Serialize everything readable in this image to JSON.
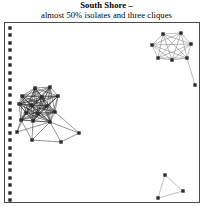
{
  "chart_title": "South Shore –",
  "chart_subtitle": "almost 50% isolates and three cliques",
  "colors": {
    "node": "#2b2b2b",
    "edge": "#6b6b6b",
    "edge_dark": "#1a1a1a",
    "frame": "#4a4a4a",
    "background": "#ffffff",
    "text": "#000000"
  },
  "chart_data": {
    "type": "scatter",
    "subtype": "network-graph",
    "title": "South Shore –",
    "subtitle": "almost 50% isolates and three cliques",
    "xlabel": "",
    "ylabel": "",
    "grid": false,
    "legend": "none",
    "xlim": [
      0,
      213
    ],
    "ylim": [
      0,
      207
    ],
    "summary": {
      "isolates_count": 24,
      "cliques_count": 3,
      "isolate_fraction_label": "almost 50%",
      "total_nodes": 50
    },
    "node_style": {
      "shape": "square",
      "size_px": 3.4,
      "color": "#2b2b2b"
    },
    "groups": [
      {
        "name": "isolates-column",
        "kind": "isolates",
        "node_count": 24,
        "edge_count": 0
      },
      {
        "name": "left-clique",
        "kind": "dense-clique",
        "node_count": 14,
        "pendant_count": 4,
        "description": "dense near-complete cluster on lower left with pendant nodes"
      },
      {
        "name": "top-right-clique",
        "kind": "dense-clique",
        "node_count": 7,
        "pendant_count": 1,
        "description": "near-complete 7-node clique upper right with one pendant"
      },
      {
        "name": "bottom-right-triangle",
        "kind": "triangle",
        "node_count": 3,
        "edge_count": 3,
        "description": "three-node triangle lower right"
      }
    ],
    "nodes": [
      {
        "id": "i1",
        "x": 10,
        "y": 28,
        "group": "isolates-column"
      },
      {
        "id": "i2",
        "x": 10,
        "y": 35,
        "group": "isolates-column"
      },
      {
        "id": "i3",
        "x": 10,
        "y": 43,
        "group": "isolates-column"
      },
      {
        "id": "i4",
        "x": 10,
        "y": 50,
        "group": "isolates-column"
      },
      {
        "id": "i5",
        "x": 10,
        "y": 58,
        "group": "isolates-column"
      },
      {
        "id": "i6",
        "x": 10,
        "y": 65,
        "group": "isolates-column"
      },
      {
        "id": "i7",
        "x": 10,
        "y": 73,
        "group": "isolates-column"
      },
      {
        "id": "i8",
        "x": 10,
        "y": 80,
        "group": "isolates-column"
      },
      {
        "id": "i9",
        "x": 10,
        "y": 88,
        "group": "isolates-column"
      },
      {
        "id": "i10",
        "x": 10,
        "y": 95,
        "group": "isolates-column"
      },
      {
        "id": "i11",
        "x": 10,
        "y": 103,
        "group": "isolates-column"
      },
      {
        "id": "i12",
        "x": 10,
        "y": 110,
        "group": "isolates-column"
      },
      {
        "id": "i13",
        "x": 10,
        "y": 118,
        "group": "isolates-column"
      },
      {
        "id": "i14",
        "x": 10,
        "y": 125,
        "group": "isolates-column"
      },
      {
        "id": "i15",
        "x": 10,
        "y": 133,
        "group": "isolates-column"
      },
      {
        "id": "i16",
        "x": 10,
        "y": 140,
        "group": "isolates-column"
      },
      {
        "id": "i17",
        "x": 10,
        "y": 148,
        "group": "isolates-column"
      },
      {
        "id": "i18",
        "x": 10,
        "y": 155,
        "group": "isolates-column"
      },
      {
        "id": "i19",
        "x": 10,
        "y": 163,
        "group": "isolates-column"
      },
      {
        "id": "i20",
        "x": 10,
        "y": 170,
        "group": "isolates-column"
      },
      {
        "id": "i21",
        "x": 10,
        "y": 178,
        "group": "isolates-column"
      },
      {
        "id": "i22",
        "x": 10,
        "y": 185,
        "group": "isolates-column"
      },
      {
        "id": "i23",
        "x": 10,
        "y": 193,
        "group": "isolates-column"
      },
      {
        "id": "i24",
        "x": 10,
        "y": 200,
        "group": "isolates-column"
      },
      {
        "id": "L1",
        "x": 35,
        "y": 88,
        "group": "left-clique"
      },
      {
        "id": "L2",
        "x": 50,
        "y": 87,
        "group": "left-clique"
      },
      {
        "id": "L3",
        "x": 22,
        "y": 96,
        "group": "left-clique"
      },
      {
        "id": "L4",
        "x": 42,
        "y": 97,
        "group": "left-clique"
      },
      {
        "id": "L5",
        "x": 58,
        "y": 96,
        "group": "left-clique"
      },
      {
        "id": "L6",
        "x": 19,
        "y": 104,
        "group": "left-clique"
      },
      {
        "id": "L7",
        "x": 31,
        "y": 105,
        "group": "left-clique"
      },
      {
        "id": "L8",
        "x": 47,
        "y": 106,
        "group": "left-clique"
      },
      {
        "id": "L9",
        "x": 26,
        "y": 113,
        "group": "left-clique"
      },
      {
        "id": "L10",
        "x": 38,
        "y": 114,
        "group": "left-clique"
      },
      {
        "id": "L11",
        "x": 55,
        "y": 112,
        "group": "left-clique"
      },
      {
        "id": "L12",
        "x": 21,
        "y": 120,
        "group": "left-clique"
      },
      {
        "id": "L13",
        "x": 33,
        "y": 121,
        "group": "left-clique"
      },
      {
        "id": "L14",
        "x": 50,
        "y": 122,
        "group": "left-clique"
      },
      {
        "id": "P1",
        "x": 32,
        "y": 140,
        "group": "left-clique",
        "role": "pendant"
      },
      {
        "id": "P2",
        "x": 17,
        "y": 132,
        "group": "left-clique",
        "role": "pendant"
      },
      {
        "id": "P3",
        "x": 61,
        "y": 142,
        "group": "left-clique",
        "role": "pendant"
      },
      {
        "id": "P4",
        "x": 79,
        "y": 133,
        "group": "left-clique",
        "role": "pendant"
      },
      {
        "id": "T1",
        "x": 163,
        "y": 34,
        "group": "top-right-clique"
      },
      {
        "id": "T2",
        "x": 181,
        "y": 33,
        "group": "top-right-clique"
      },
      {
        "id": "T3",
        "x": 152,
        "y": 45,
        "group": "top-right-clique"
      },
      {
        "id": "T4",
        "x": 191,
        "y": 44,
        "group": "top-right-clique"
      },
      {
        "id": "T5",
        "x": 158,
        "y": 58,
        "group": "top-right-clique"
      },
      {
        "id": "T6",
        "x": 172,
        "y": 60,
        "group": "top-right-clique"
      },
      {
        "id": "T7",
        "x": 187,
        "y": 58,
        "group": "top-right-clique"
      },
      {
        "id": "T8",
        "x": 195,
        "y": 85,
        "group": "top-right-clique",
        "role": "pendant"
      },
      {
        "id": "B1",
        "x": 165,
        "y": 175,
        "group": "bottom-right-triangle"
      },
      {
        "id": "B2",
        "x": 183,
        "y": 191,
        "group": "bottom-right-triangle"
      },
      {
        "id": "B3",
        "x": 158,
        "y": 198,
        "group": "bottom-right-triangle"
      }
    ],
    "edges": [
      [
        "L1",
        "L2"
      ],
      [
        "L1",
        "L3"
      ],
      [
        "L1",
        "L4"
      ],
      [
        "L1",
        "L5"
      ],
      [
        "L1",
        "L6"
      ],
      [
        "L1",
        "L7"
      ],
      [
        "L1",
        "L8"
      ],
      [
        "L1",
        "L9"
      ],
      [
        "L1",
        "L10"
      ],
      [
        "L1",
        "L11"
      ],
      [
        "L1",
        "L12"
      ],
      [
        "L1",
        "L13"
      ],
      [
        "L1",
        "L14"
      ],
      [
        "L2",
        "L3"
      ],
      [
        "L2",
        "L4"
      ],
      [
        "L2",
        "L5"
      ],
      [
        "L2",
        "L6"
      ],
      [
        "L2",
        "L7"
      ],
      [
        "L2",
        "L8"
      ],
      [
        "L2",
        "L9"
      ],
      [
        "L2",
        "L10"
      ],
      [
        "L2",
        "L11"
      ],
      [
        "L2",
        "L13"
      ],
      [
        "L2",
        "L14"
      ],
      [
        "L3",
        "L4"
      ],
      [
        "L3",
        "L5"
      ],
      [
        "L3",
        "L6"
      ],
      [
        "L3",
        "L7"
      ],
      [
        "L3",
        "L8"
      ],
      [
        "L3",
        "L9"
      ],
      [
        "L3",
        "L10"
      ],
      [
        "L3",
        "L11"
      ],
      [
        "L3",
        "L12"
      ],
      [
        "L3",
        "L13"
      ],
      [
        "L3",
        "L14"
      ],
      [
        "L4",
        "L5"
      ],
      [
        "L4",
        "L6"
      ],
      [
        "L4",
        "L7"
      ],
      [
        "L4",
        "L8"
      ],
      [
        "L4",
        "L9"
      ],
      [
        "L4",
        "L10"
      ],
      [
        "L4",
        "L11"
      ],
      [
        "L4",
        "L12"
      ],
      [
        "L4",
        "L13"
      ],
      [
        "L4",
        "L14"
      ],
      [
        "L5",
        "L6"
      ],
      [
        "L5",
        "L7"
      ],
      [
        "L5",
        "L8"
      ],
      [
        "L5",
        "L10"
      ],
      [
        "L5",
        "L11"
      ],
      [
        "L5",
        "L13"
      ],
      [
        "L5",
        "L14"
      ],
      [
        "L6",
        "L7"
      ],
      [
        "L6",
        "L8"
      ],
      [
        "L6",
        "L9"
      ],
      [
        "L6",
        "L10"
      ],
      [
        "L6",
        "L11"
      ],
      [
        "L6",
        "L12"
      ],
      [
        "L6",
        "L13"
      ],
      [
        "L6",
        "L14"
      ],
      [
        "L7",
        "L8"
      ],
      [
        "L7",
        "L9"
      ],
      [
        "L7",
        "L10"
      ],
      [
        "L7",
        "L11"
      ],
      [
        "L7",
        "L12"
      ],
      [
        "L7",
        "L13"
      ],
      [
        "L7",
        "L14"
      ],
      [
        "L8",
        "L9"
      ],
      [
        "L8",
        "L10"
      ],
      [
        "L8",
        "L11"
      ],
      [
        "L8",
        "L12"
      ],
      [
        "L8",
        "L13"
      ],
      [
        "L8",
        "L14"
      ],
      [
        "L9",
        "L10"
      ],
      [
        "L9",
        "L11"
      ],
      [
        "L9",
        "L12"
      ],
      [
        "L9",
        "L13"
      ],
      [
        "L9",
        "L14"
      ],
      [
        "L10",
        "L11"
      ],
      [
        "L10",
        "L12"
      ],
      [
        "L10",
        "L13"
      ],
      [
        "L10",
        "L14"
      ],
      [
        "L11",
        "L12"
      ],
      [
        "L11",
        "L13"
      ],
      [
        "L11",
        "L14"
      ],
      [
        "L12",
        "L13"
      ],
      [
        "L12",
        "L14"
      ],
      [
        "L13",
        "L14"
      ],
      [
        "L14",
        "P1"
      ],
      [
        "L14",
        "P2"
      ],
      [
        "L14",
        "P3"
      ],
      [
        "L14",
        "P4"
      ],
      [
        "L12",
        "P1"
      ],
      [
        "L12",
        "P2"
      ],
      [
        "L13",
        "P1"
      ],
      [
        "L9",
        "P2"
      ],
      [
        "L11",
        "P4"
      ],
      [
        "P1",
        "P3"
      ],
      [
        "P3",
        "P4"
      ],
      [
        "T1",
        "T2"
      ],
      [
        "T1",
        "T3"
      ],
      [
        "T1",
        "T4"
      ],
      [
        "T1",
        "T5"
      ],
      [
        "T1",
        "T6"
      ],
      [
        "T1",
        "T7"
      ],
      [
        "T2",
        "T3"
      ],
      [
        "T2",
        "T4"
      ],
      [
        "T2",
        "T5"
      ],
      [
        "T2",
        "T6"
      ],
      [
        "T2",
        "T7"
      ],
      [
        "T3",
        "T4"
      ],
      [
        "T3",
        "T5"
      ],
      [
        "T3",
        "T6"
      ],
      [
        "T3",
        "T7"
      ],
      [
        "T4",
        "T5"
      ],
      [
        "T4",
        "T6"
      ],
      [
        "T4",
        "T7"
      ],
      [
        "T5",
        "T6"
      ],
      [
        "T5",
        "T7"
      ],
      [
        "T6",
        "T7"
      ],
      [
        "T7",
        "T8"
      ],
      [
        "B1",
        "B2"
      ],
      [
        "B2",
        "B3"
      ],
      [
        "B3",
        "B1"
      ]
    ]
  }
}
